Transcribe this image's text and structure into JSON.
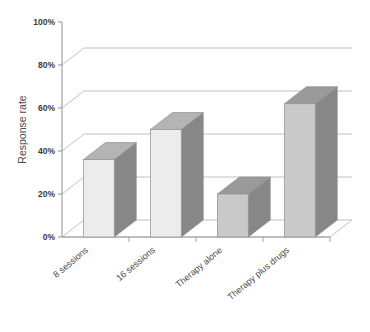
{
  "chart_data": {
    "type": "bar",
    "title": "",
    "subtitle": "",
    "xlabel": "",
    "ylabel": "Response rate",
    "categories": [
      "8 sessions",
      "16 sessions",
      "Therapy alone",
      "Therapy plus drugs"
    ],
    "values": [
      36,
      50,
      20,
      62
    ],
    "value_suffix": "%",
    "ylim": [
      0,
      100
    ],
    "yticks": [
      0,
      20,
      40,
      60,
      80,
      100
    ],
    "ytick_labels": [
      "0%",
      "20%",
      "40%",
      "60%",
      "80%",
      "100%"
    ],
    "grid": true,
    "grid_axis": "y",
    "legend": false,
    "legend_position": "none",
    "three_d": true,
    "series": [
      {
        "name": "Response rate",
        "values": [
          36,
          50,
          20,
          62
        ]
      }
    ],
    "annotations": []
  },
  "style": {
    "bar_front_light": "#ececec",
    "bar_front_mid": "#c9c9c9",
    "bar_side": "#878787",
    "bar_top": "#b4b4b4",
    "bar_top_dark": "#9a9a9a",
    "bar_outline": "#8f8f8f",
    "grid_color": "#b9b9b9",
    "axis_color": "#9a9a9a",
    "floor_fill": "#ffffff",
    "text_color": "#4a4a4a",
    "tick_text_color": "#3a3a3a",
    "background": "#ffffff"
  },
  "bar_faces": [
    {
      "front": "#ececec",
      "top": "#b4b4b4",
      "side": "#878787"
    },
    {
      "front": "#ececec",
      "top": "#b4b4b4",
      "side": "#878787"
    },
    {
      "front": "#c9c9c9",
      "top": "#9a9a9a",
      "side": "#878787"
    },
    {
      "front": "#c9c9c9",
      "top": "#9a9a9a",
      "side": "#878787"
    }
  ]
}
